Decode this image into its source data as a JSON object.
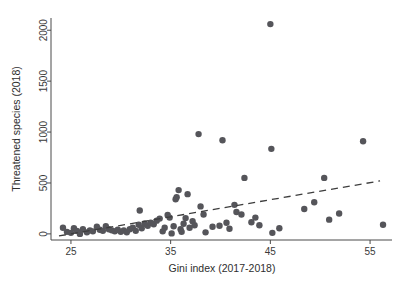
{
  "chart_data": {
    "type": "scatter",
    "title": "",
    "xlabel": "Gini index (2017-2018)",
    "ylabel": "Threatened species (2018)",
    "xlim": [
      23.0,
      57.2
    ],
    "ylim": [
      -60,
      2120
    ],
    "xticks": [
      25,
      35,
      45,
      55
    ],
    "xtick_labels": [
      "25",
      "35",
      "45",
      "55"
    ],
    "yticks": [
      0,
      500,
      1000,
      1500,
      2000
    ],
    "ytick_labels": [
      "0",
      "500",
      "1000",
      "1500",
      "2000"
    ],
    "grid": false,
    "legend": null,
    "marker_color": "#55555a",
    "marker_size": 3.2,
    "axis_color": "#4a4a4a",
    "series": [
      {
        "name": "Countries",
        "points": [
          [
            24.2,
            60
          ],
          [
            24.6,
            20
          ],
          [
            25.0,
            10
          ],
          [
            25.3,
            55
          ],
          [
            25.6,
            30
          ],
          [
            25.9,
            0
          ],
          [
            26.2,
            45
          ],
          [
            26.6,
            15
          ],
          [
            26.9,
            35
          ],
          [
            27.2,
            25
          ],
          [
            27.6,
            70
          ],
          [
            27.9,
            40
          ],
          [
            28.2,
            30
          ],
          [
            28.5,
            75
          ],
          [
            28.8,
            45
          ],
          [
            29.1,
            35
          ],
          [
            29.4,
            25
          ],
          [
            29.7,
            40
          ],
          [
            30.0,
            20
          ],
          [
            30.3,
            35
          ],
          [
            30.6,
            15
          ],
          [
            30.9,
            45
          ],
          [
            31.2,
            60
          ],
          [
            31.5,
            30
          ],
          [
            31.8,
            90
          ],
          [
            31.9,
            230
          ],
          [
            32.1,
            55
          ],
          [
            32.4,
            100
          ],
          [
            32.7,
            80
          ],
          [
            33.0,
            110
          ],
          [
            33.3,
            95
          ],
          [
            33.6,
            130
          ],
          [
            33.9,
            150
          ],
          [
            34.2,
            25
          ],
          [
            34.4,
            60
          ],
          [
            34.7,
            185
          ],
          [
            34.9,
            160
          ],
          [
            35.1,
            5
          ],
          [
            35.3,
            75
          ],
          [
            35.5,
            340
          ],
          [
            35.6,
            360
          ],
          [
            35.8,
            430
          ],
          [
            36.0,
            45
          ],
          [
            36.1,
            20
          ],
          [
            36.3,
            100
          ],
          [
            36.5,
            155
          ],
          [
            36.7,
            390
          ],
          [
            36.9,
            60
          ],
          [
            37.2,
            125
          ],
          [
            37.4,
            85
          ],
          [
            37.8,
            980
          ],
          [
            38.0,
            270
          ],
          [
            38.3,
            190
          ],
          [
            38.5,
            15
          ],
          [
            39.2,
            70
          ],
          [
            39.9,
            80
          ],
          [
            40.2,
            920
          ],
          [
            40.6,
            110
          ],
          [
            40.9,
            50
          ],
          [
            41.4,
            285
          ],
          [
            41.6,
            215
          ],
          [
            42.1,
            190
          ],
          [
            42.4,
            550
          ],
          [
            43.1,
            115
          ],
          [
            43.5,
            160
          ],
          [
            43.9,
            85
          ],
          [
            45.0,
            2060
          ],
          [
            45.1,
            835
          ],
          [
            45.2,
            10
          ],
          [
            45.9,
            55
          ],
          [
            48.4,
            245
          ],
          [
            49.4,
            310
          ],
          [
            50.4,
            550
          ],
          [
            50.9,
            140
          ],
          [
            51.9,
            200
          ],
          [
            54.3,
            910
          ],
          [
            56.3,
            90
          ]
        ]
      }
    ],
    "fit_line": {
      "style": "dashed",
      "x_start": 23.8,
      "y_start": -20,
      "x_end": 56.0,
      "y_end": 520
    }
  },
  "figure": {
    "background_color": "#ffffff",
    "plot_area": {
      "left_px": 51,
      "right_px": 392,
      "top_px": 18,
      "bottom_px": 240
    }
  }
}
